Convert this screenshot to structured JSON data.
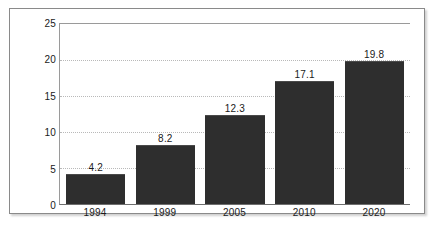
{
  "chart_data": {
    "type": "bar",
    "title": "",
    "subtitle": "",
    "xlabel": "",
    "ylabel": "",
    "categories": [
      "1994",
      "1999",
      "2005",
      "2010",
      "2020"
    ],
    "values": [
      4.2,
      8.2,
      12.3,
      17.1,
      19.8
    ],
    "value_labels": [
      "4.2",
      "8.2",
      "12.3",
      "17.1",
      "19.8"
    ],
    "ylim": [
      0,
      25
    ],
    "y_ticks": [
      0,
      5,
      10,
      15,
      20,
      25
    ],
    "y_tick_labels": [
      "0",
      "5",
      "10",
      "15",
      "20",
      "25"
    ],
    "grid": true,
    "grid_style": "dotted",
    "legend": false,
    "legend_position": "none",
    "bar_color": "#2e2e2e",
    "grid_color": "#b9b9b9",
    "axis_color": "#8a8a8a",
    "text_color": "#1a1a1a",
    "background_color": "#ffffff"
  }
}
